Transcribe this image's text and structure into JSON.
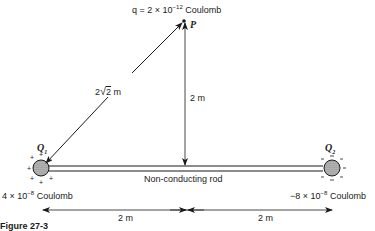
{
  "figure": {
    "caption": "Figure 27-3",
    "test_charge": {
      "label_prefix": "q = 2 × 10",
      "exponent": "−12",
      "unit": " Coulomb",
      "point_label": "P"
    },
    "diagonal_distance": {
      "prefix": "2",
      "radical": "2",
      "unit": " m"
    },
    "vertical_distance": "2 m",
    "rod_label": "Non-conducting rod",
    "charge1": {
      "symbol": "Q",
      "subscript": "1",
      "value_prefix": "4 × 10",
      "exponent": "−8",
      "unit": " Coulomb",
      "sign": "+"
    },
    "charge2": {
      "symbol": "Q",
      "subscript": "2",
      "value_prefix": "−8 × 10",
      "exponent": "−8",
      "unit": " Coulomb",
      "sign": "−"
    },
    "left_span": "2 m",
    "right_span": "2 m"
  }
}
